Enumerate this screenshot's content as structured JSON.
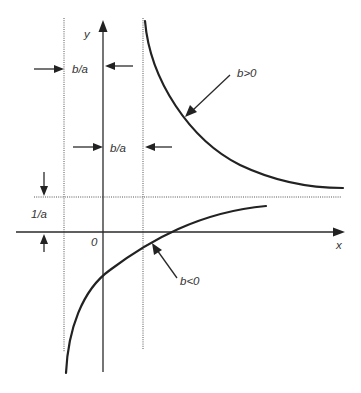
{
  "diagram": {
    "type": "hyperbola-asymptotes",
    "axes": {
      "x_label": "x",
      "y_label": "y",
      "origin_label": "0"
    },
    "dimensions": {
      "left_gap_label": "b/a",
      "right_gap_label": "b/a",
      "height_label": "1/a"
    },
    "curves": [
      {
        "id": "upper",
        "label": "b>0"
      },
      {
        "id": "lower",
        "label": "b<0"
      }
    ],
    "colors": {
      "ink": "#222222",
      "guides": "#555555",
      "background": "#ffffff"
    }
  }
}
